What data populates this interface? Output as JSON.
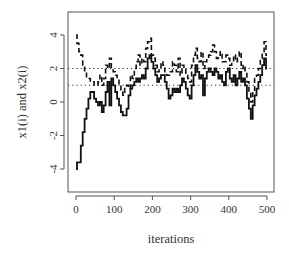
{
  "chart_data": {
    "type": "line",
    "title": "",
    "xlabel": "iterations",
    "ylabel": "x1(i) and x2(i)",
    "xlim": [
      0,
      500
    ],
    "ylim": [
      -5.5,
      5.4
    ],
    "xticks": [
      0,
      100,
      200,
      300,
      400,
      500
    ],
    "yticks": [
      -4,
      -2,
      0,
      2,
      4
    ],
    "grid": false,
    "legend": null,
    "reference_lines": [
      {
        "y": 2,
        "style": "dotted"
      },
      {
        "y": 1,
        "style": "dotted"
      }
    ],
    "series": [
      {
        "name": "x1(i)",
        "style": "solid",
        "x": [
          0,
          5,
          10,
          15,
          20,
          25,
          30,
          35,
          40,
          45,
          50,
          55,
          60,
          65,
          70,
          75,
          80,
          85,
          90,
          95,
          100,
          105,
          110,
          115,
          120,
          125,
          130,
          135,
          140,
          145,
          150,
          155,
          160,
          165,
          170,
          175,
          180,
          185,
          190,
          195,
          200,
          205,
          210,
          215,
          220,
          225,
          230,
          235,
          240,
          245,
          250,
          255,
          260,
          265,
          270,
          275,
          280,
          285,
          290,
          295,
          300,
          305,
          310,
          315,
          320,
          325,
          330,
          335,
          340,
          345,
          350,
          355,
          360,
          365,
          370,
          375,
          380,
          385,
          390,
          395,
          400,
          405,
          410,
          415,
          420,
          425,
          430,
          435,
          440,
          445,
          450,
          455,
          460,
          465,
          470,
          475,
          480,
          485,
          490,
          495,
          500
        ],
        "values": [
          -4.0,
          -3.6,
          -3.6,
          -2.6,
          -1.8,
          -1.0,
          -0.4,
          0.2,
          0.6,
          0.6,
          0.2,
          0.0,
          -0.2,
          0.0,
          -0.6,
          -0.2,
          0.6,
          1.2,
          -0.2,
          1.4,
          1.0,
          0.6,
          0.2,
          -0.2,
          -0.6,
          -0.8,
          -0.8,
          -0.4,
          0.4,
          0.8,
          1.0,
          1.2,
          1.4,
          1.2,
          1.4,
          1.6,
          1.4,
          2.0,
          2.6,
          2.8,
          2.4,
          2.0,
          1.6,
          1.2,
          1.4,
          1.6,
          1.6,
          1.2,
          0.8,
          0.2,
          0.4,
          0.8,
          0.6,
          0.8,
          0.6,
          1.0,
          1.4,
          1.2,
          0.8,
          0.4,
          0.2,
          1.0,
          1.6,
          2.2,
          1.8,
          1.4,
          1.6,
          0.4,
          1.4,
          1.8,
          2.0,
          1.8,
          1.6,
          2.0,
          1.8,
          1.4,
          1.6,
          1.2,
          1.0,
          1.8,
          2.0,
          1.4,
          1.2,
          1.6,
          1.0,
          1.4,
          1.8,
          1.2,
          1.4,
          1.0,
          0.2,
          -0.4,
          -1.0,
          -0.2,
          0.4,
          0.8,
          1.2,
          1.6,
          2.2,
          2.6,
          2.0
        ]
      },
      {
        "name": "x2(i)",
        "style": "dashed",
        "x": [
          0,
          5,
          10,
          15,
          20,
          25,
          30,
          35,
          40,
          45,
          50,
          55,
          60,
          65,
          70,
          75,
          80,
          85,
          90,
          95,
          100,
          105,
          110,
          115,
          120,
          125,
          130,
          135,
          140,
          145,
          150,
          155,
          160,
          165,
          170,
          175,
          180,
          185,
          190,
          195,
          200,
          205,
          210,
          215,
          220,
          225,
          230,
          235,
          240,
          245,
          250,
          255,
          260,
          265,
          270,
          275,
          280,
          285,
          290,
          295,
          300,
          305,
          310,
          315,
          320,
          325,
          330,
          335,
          340,
          345,
          350,
          355,
          360,
          365,
          370,
          375,
          380,
          385,
          390,
          395,
          400,
          405,
          410,
          415,
          420,
          425,
          430,
          435,
          440,
          445,
          450,
          455,
          460,
          465,
          470,
          475,
          480,
          485,
          490,
          495,
          500
        ],
        "values": [
          4.0,
          3.5,
          3.0,
          2.8,
          2.2,
          1.8,
          1.4,
          1.4,
          1.2,
          1.2,
          1.0,
          1.0,
          1.2,
          1.6,
          1.0,
          1.4,
          2.2,
          2.0,
          2.6,
          2.0,
          1.8,
          1.6,
          1.4,
          1.0,
          0.6,
          0.4,
          0.8,
          1.0,
          0.8,
          1.6,
          1.4,
          2.0,
          2.4,
          2.8,
          2.2,
          2.6,
          2.4,
          3.2,
          3.6,
          3.8,
          2.8,
          2.6,
          2.2,
          1.8,
          2.0,
          2.4,
          2.2,
          1.8,
          1.6,
          1.6,
          1.8,
          2.4,
          2.2,
          1.8,
          2.6,
          1.6,
          2.2,
          2.0,
          1.6,
          1.4,
          1.2,
          2.2,
          2.8,
          3.2,
          2.6,
          2.4,
          3.0,
          2.0,
          2.4,
          2.6,
          2.8,
          3.0,
          3.4,
          3.0,
          2.6,
          2.8,
          3.0,
          2.4,
          2.4,
          2.8,
          2.6,
          2.2,
          2.4,
          2.8,
          2.4,
          2.6,
          3.0,
          2.0,
          2.2,
          1.8,
          1.2,
          0.6,
          0.0,
          0.6,
          1.4,
          1.6,
          2.0,
          2.6,
          3.0,
          3.6,
          2.8
        ]
      }
    ]
  }
}
